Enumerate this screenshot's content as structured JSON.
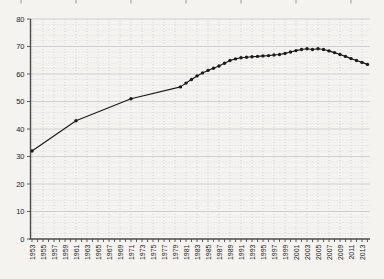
{
  "figure": {
    "title": ""
  },
  "chart_data": {
    "type": "line",
    "title": "",
    "subtitle": "",
    "xlabel": "",
    "ylabel": "",
    "x_range": [
      1953,
      2014
    ],
    "ylim": [
      0,
      80
    ],
    "y_major_step": 10,
    "y_minor_step": 2,
    "x_label_step": 2,
    "x_tick_step": 1,
    "grid": true,
    "legend_position": "none",
    "line_color": "#1a1a1a",
    "marker": "dot",
    "grid_major_color": "#c6c6c6",
    "grid_minor_color": "#d2d2d2",
    "axis_color": "#4d4d4d",
    "tick_label_color": "#1a1a1a",
    "background_color": "#f5f3f0",
    "y_tick_labels": [
      "0",
      "10",
      "20",
      "30",
      "40",
      "50",
      "60",
      "70",
      "80"
    ],
    "x_tick_labels": [
      "1953",
      "1955",
      "1957",
      "1959",
      "1961",
      "1963",
      "1965",
      "1967",
      "1969",
      "1971",
      "1973",
      "1975",
      "1977",
      "1979",
      "1981",
      "1983",
      "1985",
      "1987",
      "1989",
      "1991",
      "1993",
      "1995",
      "1997",
      "1999",
      "2001",
      "2003",
      "2005",
      "2007",
      "2009",
      "2011",
      "2013"
    ],
    "top_edge_tick_years": [
      1951,
      1961,
      1971,
      1981,
      1991,
      2001,
      2011
    ],
    "series": [
      {
        "name": "series-1",
        "points": [
          [
            1953,
            32
          ],
          [
            1961,
            43
          ],
          [
            1971,
            51
          ],
          [
            1980,
            55.3
          ],
          [
            1981,
            56.7
          ],
          [
            1982,
            58.0
          ],
          [
            1983,
            59.3
          ],
          [
            1984,
            60.4
          ],
          [
            1985,
            61.3
          ],
          [
            1986,
            62.1
          ],
          [
            1987,
            62.9
          ],
          [
            1988,
            63.9
          ],
          [
            1989,
            64.9
          ],
          [
            1990,
            65.5
          ],
          [
            1991,
            65.9
          ],
          [
            1992,
            66.1
          ],
          [
            1993,
            66.3
          ],
          [
            1994,
            66.4
          ],
          [
            1995,
            66.6
          ],
          [
            1996,
            66.7
          ],
          [
            1997,
            66.9
          ],
          [
            1998,
            67.1
          ],
          [
            1999,
            67.5
          ],
          [
            2000,
            68.0
          ],
          [
            2001,
            68.5
          ],
          [
            2002,
            68.9
          ],
          [
            2003,
            69.2
          ],
          [
            2004,
            68.9
          ],
          [
            2005,
            69.2
          ],
          [
            2006,
            68.9
          ],
          [
            2007,
            68.4
          ],
          [
            2008,
            67.8
          ],
          [
            2009,
            67.1
          ],
          [
            2010,
            66.4
          ],
          [
            2011,
            65.6
          ],
          [
            2012,
            64.9
          ],
          [
            2013,
            64.2
          ],
          [
            2014,
            63.5
          ]
        ]
      }
    ]
  }
}
